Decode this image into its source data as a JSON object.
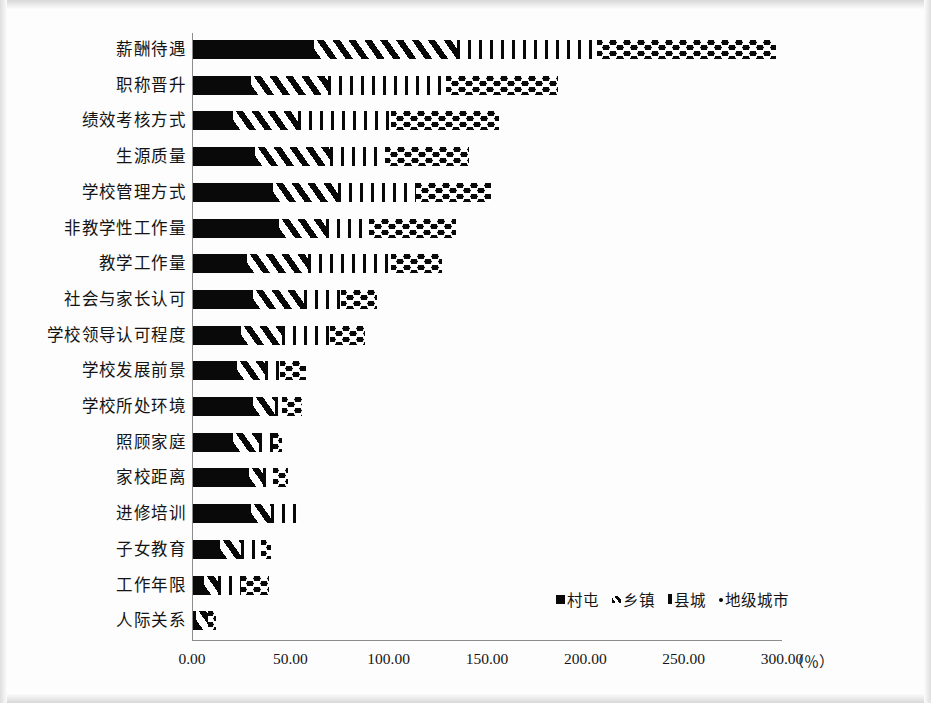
{
  "chart_data": {
    "type": "bar",
    "orientation": "horizontal",
    "stacked": true,
    "title": "",
    "xlabel": "",
    "ylabel": "",
    "unit_label": "（％）",
    "xlim": [
      0,
      300
    ],
    "grid": false,
    "legend_position": "bottom-right",
    "x_ticks": [
      "0.00",
      "50.00",
      "100.00",
      "150.00",
      "200.00",
      "250.00",
      "300.00"
    ],
    "x_tick_values": [
      0,
      50,
      100,
      150,
      200,
      250,
      300
    ],
    "categories": [
      "薪酬待遇",
      "职称晋升",
      "绩效考核方式",
      "生源质量",
      "学校管理方式",
      "非教学性工作量",
      "教学工作量",
      "社会与家长认可",
      "学校领导认可程度",
      "学校发展前景",
      "学校所处环境",
      "照顾家庭",
      "家校距离",
      "进修培训",
      "子女教育",
      "工作年限",
      "人际关系"
    ],
    "series": [
      {
        "name": "村屯",
        "pattern": "solid",
        "values": [
          62,
          30,
          21,
          32,
          41,
          44,
          28,
          31,
          25,
          23,
          31,
          21,
          29,
          30,
          14,
          6,
          2
        ]
      },
      {
        "name": "乡镇",
        "pattern": "diagonal-hatch",
        "values": [
          73,
          39,
          33,
          38,
          33,
          24,
          31,
          26,
          21,
          14,
          11,
          13,
          7,
          10,
          11,
          7,
          6
        ]
      },
      {
        "name": "县城",
        "pattern": "vertical-lines",
        "values": [
          71,
          60,
          47,
          28,
          40,
          22,
          42,
          19,
          24,
          8,
          4,
          7,
          5,
          14,
          10,
          12,
          0
        ]
      },
      {
        "name": "地级城市",
        "pattern": "dots",
        "values": [
          91,
          57,
          55,
          43,
          38,
          44,
          26,
          18,
          18,
          13,
          10,
          5,
          8,
          0,
          5,
          14,
          4
        ]
      }
    ],
    "totals": [
      297,
      186,
      156,
      141,
      152,
      134,
      127,
      94,
      88,
      58,
      56,
      46,
      49,
      54,
      40,
      39,
      12
    ]
  },
  "legend": {
    "items": [
      {
        "label": "村屯",
        "pattern": "solid"
      },
      {
        "label": "乡镇",
        "pattern": "diagonal-hatch"
      },
      {
        "label": "县城",
        "pattern": "vertical-lines"
      },
      {
        "label": "地级城市",
        "pattern": "dots"
      }
    ]
  },
  "colors": {
    "ink": "#090909",
    "axis": "#8c8c8c",
    "paper": "#fdfdfd"
  }
}
